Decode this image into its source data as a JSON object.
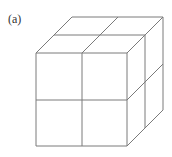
{
  "figure": {
    "label": "(a)",
    "line_color": "#7a7a7a",
    "background": "#ffffff"
  }
}
